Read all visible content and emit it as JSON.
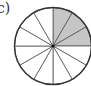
{
  "label": "c)",
  "diagram": {
    "type": "fraction-circle",
    "total_sectors": 12,
    "shaded_sectors": 3,
    "shaded_start": "12 o'clock",
    "shaded_end": "3 o'clock",
    "shade_color": "#c6c6c6",
    "line_color": "#555555",
    "outline_color": "#333333"
  }
}
